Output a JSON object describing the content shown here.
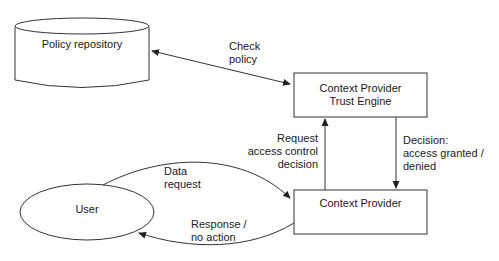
{
  "diagram": {
    "nodes": {
      "policy_repository": {
        "label": "Policy repository",
        "shape": "cylinder"
      },
      "trust_engine": {
        "line1": "Context Provider",
        "line2": "Trust Engine",
        "shape": "rectangle"
      },
      "context_provider": {
        "label": "Context Provider",
        "shape": "rectangle"
      },
      "user": {
        "label": "User",
        "shape": "ellipse"
      }
    },
    "edges": {
      "check_policy": {
        "line1": "Check",
        "line2": "policy",
        "from": "Context Provider Trust Engine",
        "to": "Policy repository",
        "bidirectional": true
      },
      "request_access": {
        "line1": "Request",
        "line2": "access control",
        "line3": "decision",
        "from": "Context Provider",
        "to": "Context Provider Trust Engine"
      },
      "decision": {
        "line1": "Decision:",
        "line2": "access granted /",
        "line3": "denied",
        "from": "Context Provider Trust Engine",
        "to": "Context Provider"
      },
      "data_request": {
        "line1": "Data",
        "line2": "request",
        "from": "User",
        "to": "Context Provider"
      },
      "response": {
        "line1": "Response /",
        "line2": "no action",
        "from": "Context Provider",
        "to": "User"
      }
    },
    "colors": {
      "stroke": "#333333",
      "text": "#1a1a1a",
      "background": "#ffffff"
    }
  }
}
